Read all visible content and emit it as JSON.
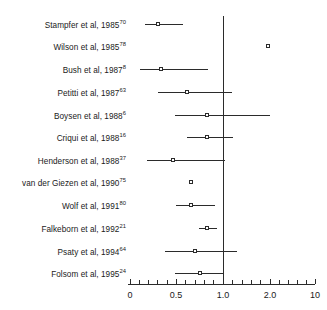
{
  "chart_data": {
    "type": "forest",
    "title": "",
    "xlabel": "",
    "ylabel": "",
    "x_scale": "log",
    "xlim": [
      0.1,
      10
    ],
    "grid": false,
    "legend": null,
    "reference_line": 1.0,
    "axis_ticks": [
      {
        "label": "0",
        "value": 0.0
      },
      {
        "label": "0.5",
        "value": 0.5
      },
      {
        "label": "1.0",
        "value": 1.0
      },
      {
        "label": "2.0",
        "value": 2.0
      },
      {
        "label": "10",
        "value": 10.0
      }
    ],
    "categories": [
      "Stampfer et al, 1985",
      "Wilson et al, 1985",
      "Bush et al, 1987",
      "Petitti et al, 1987",
      "Boysen et al, 1988",
      "Criqui et al, 1988",
      "Henderson et al, 1988",
      "van der Giezen et al, 1990",
      "Wolf et al, 1991",
      "Falkeborn et al, 1992",
      "Psaty et al, 1994",
      "Folsom et al, 1995"
    ],
    "values": [
      0.32,
      1.95,
      0.35,
      0.62,
      0.82,
      0.82,
      0.46,
      0.64,
      0.66,
      0.82,
      0.7,
      0.75
    ],
    "ci_low": [
      0.18,
      null,
      0.11,
      0.3,
      0.54,
      0.65,
      0.18,
      null,
      0.53,
      0.74,
      0.38,
      0.47
    ],
    "ci_high": [
      0.58,
      null,
      0.82,
      1.02,
      2.02,
      1.03,
      1.03,
      null,
      0.88,
      0.93,
      1.1,
      1.01
    ]
  },
  "rows": [
    {
      "label_main": "Stampfer et al, 1985",
      "label_sup": "70",
      "y": 24,
      "marker_x": 158,
      "line_x1": 145,
      "line_x2": 183,
      "has_line": true
    },
    {
      "label_main": "Wilson et al, 1985",
      "label_sup": "78",
      "y": 46,
      "marker_x": 268,
      "line_x1": 268,
      "line_x2": 268,
      "has_line": false
    },
    {
      "label_main": "Bush et al, 1987",
      "label_sup": "8",
      "y": 69,
      "marker_x": 161,
      "line_x1": 140,
      "line_x2": 208,
      "has_line": true
    },
    {
      "label_main": "Petitti et al, 1987",
      "label_sup": "63",
      "y": 92,
      "marker_x": 187,
      "line_x1": 158,
      "line_x2": 232,
      "has_line": true
    },
    {
      "label_main": "Boysen et al, 1988",
      "label_sup": "6",
      "y": 115,
      "marker_x": 207,
      "line_x1": 175,
      "line_x2": 270,
      "has_line": true
    },
    {
      "label_main": "Criqui et al, 1988",
      "label_sup": "16",
      "y": 137,
      "marker_x": 207,
      "line_x1": 187,
      "line_x2": 233,
      "has_line": true
    },
    {
      "label_main": "Henderson et al, 1988",
      "label_sup": "37",
      "y": 160,
      "marker_x": 173,
      "line_x1": 147,
      "line_x2": 225,
      "has_line": true
    },
    {
      "label_main": "van der Giezen et al, 1990",
      "label_sup": "75",
      "y": 182,
      "marker_x": 191,
      "line_x1": 191,
      "line_x2": 191,
      "has_line": false
    },
    {
      "label_main": "Wolf et al, 1991",
      "label_sup": "80",
      "y": 205,
      "marker_x": 191,
      "line_x1": 176,
      "line_x2": 215,
      "has_line": true
    },
    {
      "label_main": "Falkeborn et al, 1992",
      "label_sup": "21",
      "y": 228,
      "marker_x": 207,
      "line_x1": 199,
      "line_x2": 217,
      "has_line": true
    },
    {
      "label_main": "Psaty et al, 1994",
      "label_sup": "64",
      "y": 251,
      "marker_x": 195,
      "line_x1": 165,
      "line_x2": 237,
      "has_line": true
    },
    {
      "label_main": "Folsom et al, 1995",
      "label_sup": "24",
      "y": 273,
      "marker_x": 200,
      "line_x1": 175,
      "line_x2": 224,
      "has_line": true
    }
  ],
  "axis": {
    "line_x1": 128,
    "line_x2": 315,
    "line_y": 284,
    "ref_line_x": 223,
    "ref_line_y1": 16,
    "ref_line_y2": 284,
    "label_y": 291,
    "ticks": [
      {
        "x": 130,
        "major": true,
        "label": "0"
      },
      {
        "x": 139,
        "major": false,
        "label": ""
      },
      {
        "x": 148,
        "major": false,
        "label": ""
      },
      {
        "x": 157,
        "major": false,
        "label": ""
      },
      {
        "x": 167,
        "major": false,
        "label": ""
      },
      {
        "x": 176,
        "major": true,
        "label": "0.5"
      },
      {
        "x": 185,
        "major": false,
        "label": ""
      },
      {
        "x": 195,
        "major": false,
        "label": ""
      },
      {
        "x": 204,
        "major": false,
        "label": ""
      },
      {
        "x": 213,
        "major": false,
        "label": ""
      },
      {
        "x": 223,
        "major": true,
        "label": "1.0"
      },
      {
        "x": 232,
        "major": false,
        "label": ""
      },
      {
        "x": 242,
        "major": false,
        "label": ""
      },
      {
        "x": 251,
        "major": false,
        "label": ""
      },
      {
        "x": 260,
        "major": false,
        "label": ""
      },
      {
        "x": 270,
        "major": true,
        "label": "2.0"
      },
      {
        "x": 279,
        "major": false,
        "label": ""
      },
      {
        "x": 288,
        "major": false,
        "label": ""
      },
      {
        "x": 297,
        "major": false,
        "label": ""
      },
      {
        "x": 306,
        "major": false,
        "label": ""
      },
      {
        "x": 315,
        "major": true,
        "label": "10"
      }
    ],
    "labels": [
      {
        "x": 130,
        "text": "0"
      },
      {
        "x": 176,
        "text": "0.5"
      },
      {
        "x": 223,
        "text": "1.0"
      },
      {
        "x": 270,
        "text": "2.0"
      },
      {
        "x": 315,
        "text": "10"
      }
    ]
  },
  "style": {
    "line_color": "#2b2b2b",
    "marker_fill": "#ffffff",
    "text_color": "#1a1a1a",
    "background": "#ffffff"
  }
}
